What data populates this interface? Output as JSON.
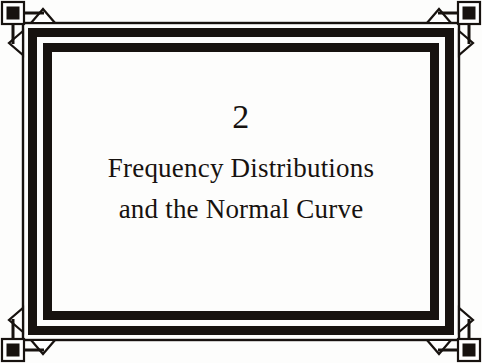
{
  "page": {
    "kind": "book-chapter-title-page",
    "background_color": "#ffffff",
    "ink_color": "#17120f"
  },
  "chapter": {
    "number": "2",
    "title_lines": [
      "Frequency Distributions",
      "and the Normal Curve"
    ],
    "full_title": "Frequency Distributions and the Normal Curve"
  },
  "ornament": {
    "style": "art-deco-double-rule-frame",
    "stroke_color": "#17120f",
    "fill_color": "#ffffff",
    "corner_motif": "square-block-with-outward-arrowheads",
    "corner_count": 4,
    "band_count": 3,
    "corners": [
      "top-left",
      "top-right",
      "bottom-left",
      "bottom-right"
    ]
  }
}
